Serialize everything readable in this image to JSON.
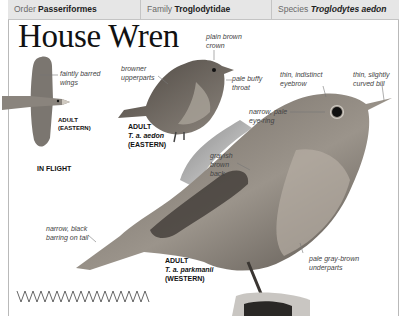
{
  "header": {
    "order_label": "Order",
    "order_value": "Passeriformes",
    "family_label": "Family",
    "family_value": "Troglodytidae",
    "species_label": "Species",
    "species_value": "Troglodytes aedon"
  },
  "title": "House Wren",
  "flight": {
    "note": [
      "faintly barred",
      "wings"
    ],
    "tag": [
      "ADULT",
      "(EASTERN)"
    ],
    "caption": "IN FLIGHT"
  },
  "eastern": {
    "notes": {
      "upperparts": [
        "browner",
        "upperparts"
      ],
      "crown": [
        "plain brown",
        "crown"
      ],
      "throat": [
        "pale buffy",
        "throat"
      ]
    },
    "tag": [
      "ADULT",
      "T. a. aedon",
      "(EASTERN)"
    ]
  },
  "western": {
    "notes": {
      "eyebrow": [
        "thin, indistinct",
        "eyebrow"
      ],
      "bill": [
        "thin, slightly",
        "curved bill"
      ],
      "eye_ring": [
        "narrow, pale",
        "eye-ring"
      ],
      "back": [
        "grayish",
        "brown",
        "back"
      ],
      "tail": [
        "narrow, black",
        "barring on tail"
      ],
      "underparts": [
        "pale gray-brown",
        "underparts"
      ]
    },
    "tag": [
      "ADULT",
      "T. a. parkmanii",
      "(WESTERN)"
    ]
  },
  "flight_pattern_icon": "zigzag-flight-pattern-icon",
  "colors": {
    "header_bg": "#e6e6e6",
    "border": "#b9b9b9",
    "bird_dark": "#3a3632",
    "bird_mid": "#7a736b",
    "bird_light": "#b8b1a8"
  }
}
